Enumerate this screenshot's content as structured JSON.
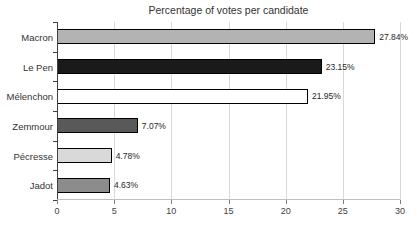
{
  "chart_data": {
    "type": "bar",
    "orientation": "horizontal",
    "title": "Percentage of votes per candidate",
    "categories": [
      "Macron",
      "Le Pen",
      "Mélenchon",
      "Zemmour",
      "Pécresse",
      "Jadot"
    ],
    "values": [
      27.84,
      23.15,
      21.95,
      7.07,
      4.78,
      4.63
    ],
    "data_labels": [
      "27.84%",
      "23.15%",
      "21.95%",
      "7.07%",
      "4.78%",
      "4.63%"
    ],
    "bar_colors": [
      "#b3b3b3",
      "#1a1a1a",
      "#ffffff",
      "#595959",
      "#d9d9d9",
      "#8c8c8c"
    ],
    "bar_border_color": "#000000",
    "xlabel": "",
    "ylabel": "",
    "xlim": [
      0,
      30
    ],
    "x_ticks": [
      "0",
      "5",
      "10",
      "15",
      "20",
      "25",
      "30"
    ],
    "grid": "vertical-only",
    "gridline_color": "#d9d9d9",
    "category_axis_color": "#404040",
    "value_axis_color": "#bfbfbf",
    "legend": "none",
    "background_color": "#ffffff"
  }
}
